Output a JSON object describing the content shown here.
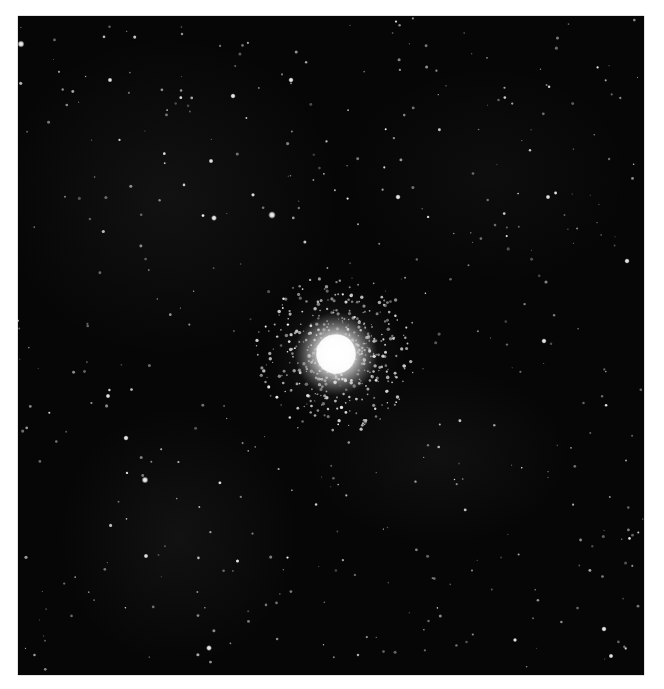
{
  "image": {
    "subject": "globular star cluster",
    "background_color": "#060606",
    "frame_color": "#ffffff",
    "width": 626,
    "height": 659,
    "cluster": {
      "cx": 318,
      "cy": 338,
      "core_radius": 22,
      "halo_radius": 70
    },
    "nebulosity": [
      {
        "cx": 150,
        "cy": 180,
        "rx": 170,
        "ry": 160,
        "opacity": 0.08
      },
      {
        "cx": 420,
        "cy": 440,
        "rx": 130,
        "ry": 90,
        "opacity": 0.07
      },
      {
        "cx": 160,
        "cy": 520,
        "rx": 120,
        "ry": 130,
        "opacity": 0.08
      },
      {
        "cx": 470,
        "cy": 160,
        "rx": 140,
        "ry": 110,
        "opacity": 0.05
      }
    ],
    "bright_stars": [
      [
        3,
        28,
        2.6
      ],
      [
        254,
        199,
        2.8
      ],
      [
        196,
        202,
        2.2
      ],
      [
        215,
        80,
        2.0
      ],
      [
        273,
        64,
        2.0
      ],
      [
        193,
        145,
        1.8
      ],
      [
        380,
        181,
        2.0
      ],
      [
        530,
        181,
        1.8
      ],
      [
        609,
        245,
        2.0
      ],
      [
        127,
        464,
        2.5
      ],
      [
        526,
        325,
        2.0
      ],
      [
        108,
        422,
        2.0
      ],
      [
        191,
        632,
        2.2
      ],
      [
        586,
        613,
        2.0
      ],
      [
        593,
        640,
        1.8
      ],
      [
        628,
        655,
        1.8
      ],
      [
        90,
        380,
        1.8
      ],
      [
        92,
        64,
        1.8
      ],
      [
        128,
        540,
        1.8
      ],
      [
        497,
        624,
        1.6
      ]
    ]
  }
}
